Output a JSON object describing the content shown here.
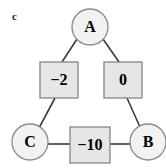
{
  "figure": {
    "panel_label": "c",
    "width": 166,
    "height": 168,
    "background": "#ffffff"
  },
  "style": {
    "node_fill": "#f2f2f2",
    "node_stroke": "#8a8a8a",
    "box_fill": "#e6e6e6",
    "box_stroke": "#7d7d7d",
    "edge_color": "#3b3b3b",
    "text_color": "#000000"
  },
  "nodes": [
    {
      "id": "A",
      "label": "A",
      "cx": 90,
      "cy": 27,
      "r": 18
    },
    {
      "id": "C",
      "label": "C",
      "cx": 30,
      "cy": 142,
      "r": 18
    },
    {
      "id": "B",
      "label": "B",
      "cx": 148,
      "cy": 142,
      "r": 18
    }
  ],
  "edges": [
    {
      "id": "A-C",
      "from": "A",
      "to": "C",
      "weight": "−2",
      "box": {
        "x": 40,
        "y": 62,
        "w": 38,
        "h": 36
      }
    },
    {
      "id": "A-B",
      "from": "A",
      "to": "B",
      "weight": "0",
      "box": {
        "x": 104,
        "y": 62,
        "w": 38,
        "h": 36
      }
    },
    {
      "id": "C-B",
      "from": "C",
      "to": "B",
      "weight": "−10",
      "box": {
        "x": 70,
        "y": 127,
        "w": 40,
        "h": 36
      }
    }
  ]
}
